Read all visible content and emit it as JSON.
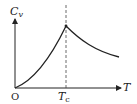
{
  "diagram": {
    "type": "heat-capacity-lambda-curve",
    "y_axis_label": "C",
    "y_axis_subscript": "v",
    "x_axis_label": "T",
    "origin_label": "O",
    "critical_label": "T",
    "critical_subscript": "c",
    "colors": {
      "line": "#222222",
      "dashed": "#444444",
      "background": "#ffffff"
    }
  }
}
